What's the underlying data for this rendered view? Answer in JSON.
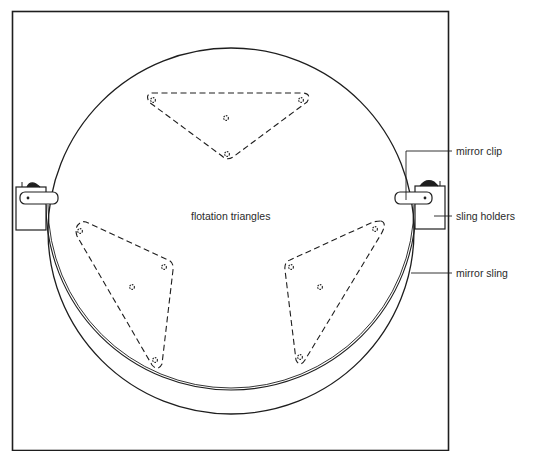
{
  "diagram": {
    "labels": {
      "flotation_triangles": "flotation triangles",
      "mirror_clip": "mirror clip",
      "sling_holders": "sling holders",
      "mirror_sling": "mirror sling"
    },
    "colors": {
      "line": "#1e1e1e",
      "text": "#2a2a2a",
      "background": "#ffffff"
    },
    "parts": [
      "frame",
      "mirror",
      "mirror-sling",
      "flotation-triangle-top",
      "flotation-triangle-left",
      "flotation-triangle-right",
      "sling-holder-left",
      "sling-holder-right",
      "mirror-clip-left",
      "mirror-clip-right"
    ]
  }
}
